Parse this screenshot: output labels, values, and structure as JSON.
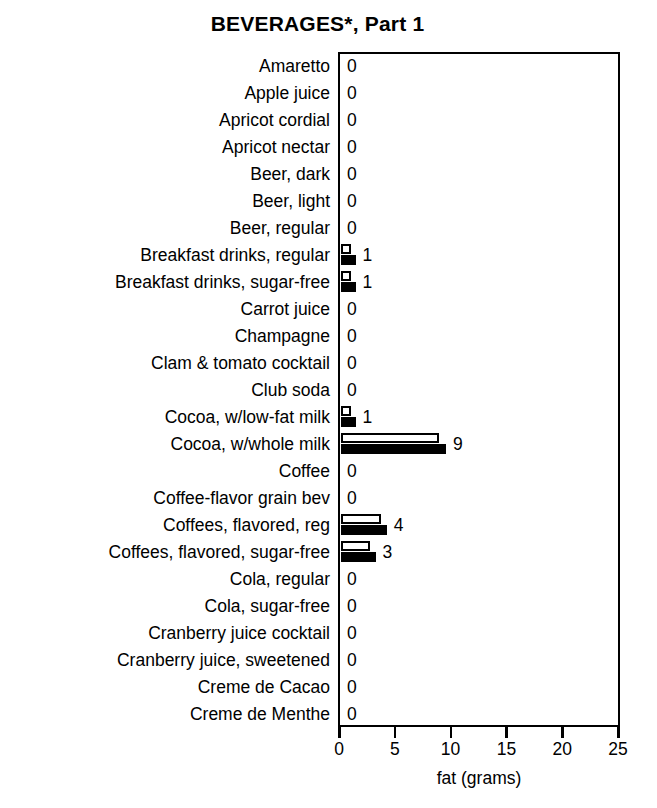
{
  "chart_data": {
    "type": "bar",
    "title": "BEVERAGES*, Part 1",
    "xlabel": "fat (grams)",
    "ylabel": "",
    "xlim": [
      0,
      25
    ],
    "xticks": [
      0,
      5,
      10,
      15,
      20,
      25
    ],
    "xtick_labels": [
      "0",
      "5",
      "10",
      "15",
      "20",
      "25"
    ],
    "orientation": "horizontal",
    "grid": false,
    "legend": null,
    "series": [
      {
        "name": "white-bar",
        "style": "hollow"
      },
      {
        "name": "black-bar",
        "style": "filled"
      }
    ],
    "categories": [
      "Amaretto",
      "Apple juice",
      "Apricot cordial",
      "Apricot nectar",
      "Beer, dark",
      "Beer, light",
      "Beer, regular",
      "Breakfast drinks, regular",
      "Breakfast drinks, sugar-free",
      "Carrot juice",
      "Champagne",
      "Clam & tomato cocktail",
      "Club soda",
      "Cocoa, w/low-fat milk",
      "Cocoa, w/whole milk",
      "Coffee",
      "Coffee-flavor grain bev",
      "Coffees, flavored, reg",
      "Coffees, flavored, sugar-free",
      "Cola, regular",
      "Cola, sugar-free",
      "Cranberry juice cocktail",
      "Cranberry juice, sweetened",
      "Creme de Cacao",
      "Creme de Menthe"
    ],
    "values": [
      0,
      0,
      0,
      0,
      0,
      0,
      0,
      1,
      1,
      0,
      0,
      0,
      0,
      1,
      9,
      0,
      0,
      4,
      3,
      0,
      0,
      0,
      0,
      0,
      0
    ],
    "rows": [
      {
        "label": "Amaretto",
        "value": 0,
        "white": 0,
        "black": 0
      },
      {
        "label": "Apple juice",
        "value": 0,
        "white": 0,
        "black": 0
      },
      {
        "label": "Apricot cordial",
        "value": 0,
        "white": 0,
        "black": 0
      },
      {
        "label": "Apricot nectar",
        "value": 0,
        "white": 0,
        "black": 0
      },
      {
        "label": "Beer, dark",
        "value": 0,
        "white": 0,
        "black": 0
      },
      {
        "label": "Beer, light",
        "value": 0,
        "white": 0,
        "black": 0
      },
      {
        "label": "Beer, regular",
        "value": 0,
        "white": 0,
        "black": 0
      },
      {
        "label": "Breakfast drinks, regular",
        "value": 1,
        "white": 0.9,
        "black": 1.3
      },
      {
        "label": "Breakfast drinks, sugar-free",
        "value": 1,
        "white": 0.9,
        "black": 1.3
      },
      {
        "label": "Carrot juice",
        "value": 0,
        "white": 0,
        "black": 0
      },
      {
        "label": "Champagne",
        "value": 0,
        "white": 0,
        "black": 0
      },
      {
        "label": "Clam & tomato cocktail",
        "value": 0,
        "white": 0,
        "black": 0
      },
      {
        "label": "Club soda",
        "value": 0,
        "white": 0,
        "black": 0
      },
      {
        "label": "Cocoa, w/low-fat milk",
        "value": 1,
        "white": 0.9,
        "black": 1.3
      },
      {
        "label": "Cocoa, w/whole milk",
        "value": 9,
        "white": 8.8,
        "black": 9.4
      },
      {
        "label": "Coffee",
        "value": 0,
        "white": 0,
        "black": 0
      },
      {
        "label": "Coffee-flavor grain bev",
        "value": 0,
        "white": 0,
        "black": 0
      },
      {
        "label": "Coffees, flavored, reg",
        "value": 4,
        "white": 3.6,
        "black": 4.1
      },
      {
        "label": "Coffees, flavored, sugar-free",
        "value": 3,
        "white": 2.6,
        "black": 3.1
      },
      {
        "label": "Cola, regular",
        "value": 0,
        "white": 0,
        "black": 0
      },
      {
        "label": "Cola, sugar-free",
        "value": 0,
        "white": 0,
        "black": 0
      },
      {
        "label": "Cranberry juice cocktail",
        "value": 0,
        "white": 0,
        "black": 0
      },
      {
        "label": "Cranberry juice, sweetened",
        "value": 0,
        "white": 0,
        "black": 0
      },
      {
        "label": "Creme de Cacao",
        "value": 0,
        "white": 0,
        "black": 0
      },
      {
        "label": "Creme de Menthe",
        "value": 0,
        "white": 0,
        "black": 0
      }
    ]
  },
  "colors": {
    "ink": "#000000",
    "paper": "#ffffff",
    "bar_filled": "#000000",
    "bar_hollow": "#ffffff"
  }
}
